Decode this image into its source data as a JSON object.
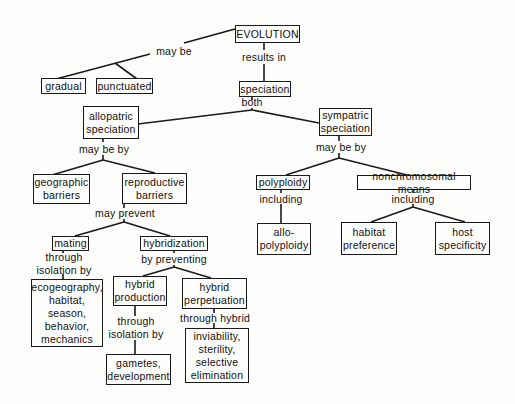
{
  "concept_map": {
    "root": "EVOLUTION",
    "nodes": {
      "evolution": "EVOLUTION",
      "gradual": "gradual",
      "punctuated": "punctuated",
      "speciation": "speciation",
      "allopatric": "allopatric\nspeciation",
      "sympatric": "sympatric\nspeciation",
      "geographic": "geographic\nbarriers",
      "reproductive": "reproductive\nbarriers",
      "mating": "mating",
      "hybridization": "hybridization",
      "ecogeography": "ecogeography,\nhabitat,\nseason,\nbehavior,\nmechanics",
      "hybrid_production": "hybrid\nproduction",
      "hybrid_perpetuation": "hybrid\nperpetuation",
      "gametes": "gametes,\ndevelopment",
      "inviability": "inviability,\nsterility,\nselective\nelimination",
      "polyploidy": "polyploidy",
      "allopolyploidy": "allo-\npolyploidy",
      "nonchromosomal": "nonchromosomal  means",
      "habitat_preference": "habitat\npreference",
      "host_specificity": "host\nspecificity"
    },
    "links": {
      "may_be": "may be",
      "results_in": "results  in",
      "both": "both",
      "allo_may_be_by": "may be by",
      "sym_may_be_by": "may be by",
      "may_prevent": "may  prevent",
      "through_isolation_by_mating": "through\nisolation  by",
      "by_preventing": "by  preventing",
      "through_isolation_by_production": "through\nisolation  by",
      "through_hybrid": "through  hybrid",
      "including_poly": "including",
      "including_nonchrom": "including"
    }
  }
}
